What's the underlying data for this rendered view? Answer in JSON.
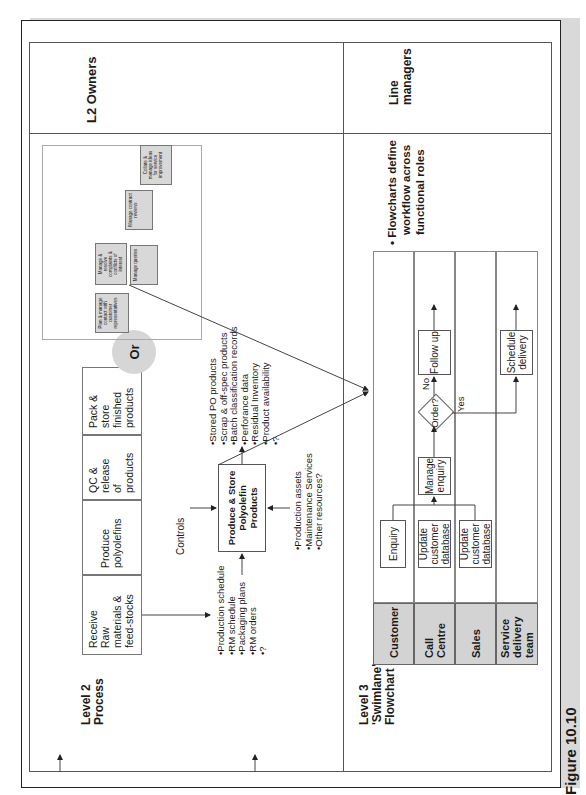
{
  "figure": {
    "caption": "Figure 10.10"
  },
  "level2": {
    "row_label": "Level 2 Process",
    "row_label_lines": [
      "Level 2",
      "Process"
    ],
    "owner_label": "L2 Owners",
    "process_steps": [
      {
        "lines": [
          "Receive",
          "Raw",
          "materials &",
          "feed-stocks"
        ]
      },
      {
        "lines": [
          "Produce",
          "polyolefins"
        ]
      },
      {
        "lines": [
          "QC &",
          "release",
          "of",
          "products"
        ]
      },
      {
        "lines": [
          "Pack &",
          "store",
          "finished",
          "products"
        ]
      }
    ],
    "or_label": "Or",
    "controls_label": "Controls",
    "central_box": {
      "lines": [
        "Produce & Store",
        "Polyolefin",
        "Products"
      ]
    },
    "inputs": [
      "Production schedule",
      "RM schedule",
      "Packaging plans",
      "RM orders",
      "?"
    ],
    "outputs": [
      "Stored PO products",
      "Scrap & off-spec products",
      "Batch classification records",
      "Perforance data",
      "Residual Inventory",
      "Product availability",
      "?"
    ],
    "mechanisms": [
      "Production assets",
      "Maintenance Services",
      "Other resources?"
    ],
    "mini_diagram": {
      "boxes": [
        {
          "text": "Plan & manage contact with customer representatives",
          "id": "3.1"
        },
        {
          "text": "Manage & resolve complaints & conflicts of interest",
          "id": "3.2"
        },
        {
          "text": "Manage queries",
          "id": "3.3"
        },
        {
          "text": "Manage contract reviews",
          "id": "3.4"
        },
        {
          "text": "Collate & manage ideas for service improvement",
          "id": "3.5"
        }
      ]
    }
  },
  "level3": {
    "row_label_lines": [
      "Level 3",
      "'Swimlane'",
      "Flowchart"
    ],
    "owner_label_lines": [
      "Line",
      "managers"
    ],
    "note": "Flowcharts define workflow across functional roles",
    "note_lines": [
      "Flowcharts define",
      "workflow across",
      "functional roles"
    ],
    "lanes": [
      {
        "name_lines": [
          "Customer"
        ]
      },
      {
        "name_lines": [
          "Call",
          "Centre"
        ]
      },
      {
        "name_lines": [
          "Sales"
        ]
      },
      {
        "name_lines": [
          "Service",
          "delivery",
          "team"
        ]
      }
    ],
    "steps": {
      "enquiry": "Enquiry",
      "update_cc": [
        "Update",
        "customer",
        "database"
      ],
      "update_sales": [
        "Update",
        "customer",
        "database"
      ],
      "manage_enquiry": [
        "Manage",
        "enquiry"
      ],
      "decision": "Order?",
      "no_label": "No",
      "yes_label": "Yes",
      "follow_up": "Follow up",
      "schedule_delivery": [
        "Schedule",
        "delivery"
      ]
    }
  },
  "colors": {
    "lane_header": "#d3d3d3",
    "or_circle": "#d6d6d6",
    "mini_box": "#d8d8d8",
    "line": "#555555"
  }
}
